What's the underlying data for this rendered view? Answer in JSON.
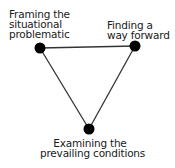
{
  "diagram": {
    "type": "triangle-cycle",
    "colors": {
      "line": "#333333",
      "node": "#000000",
      "text": "#1a1a1a",
      "background": "#ffffff"
    },
    "nodes": [
      {
        "id": "left",
        "x": 40,
        "y": 48,
        "lines": [
          "Framing the",
          "situational",
          "problematic"
        ]
      },
      {
        "id": "right",
        "x": 135,
        "y": 46,
        "lines": [
          "Finding a",
          "way forward"
        ]
      },
      {
        "id": "bottom",
        "x": 89,
        "y": 129,
        "lines": [
          "Examining the",
          "prevailing conditions"
        ]
      }
    ],
    "edges": [
      {
        "from": "left",
        "to": "right"
      },
      {
        "from": "right",
        "to": "bottom"
      },
      {
        "from": "bottom",
        "to": "left"
      }
    ]
  }
}
